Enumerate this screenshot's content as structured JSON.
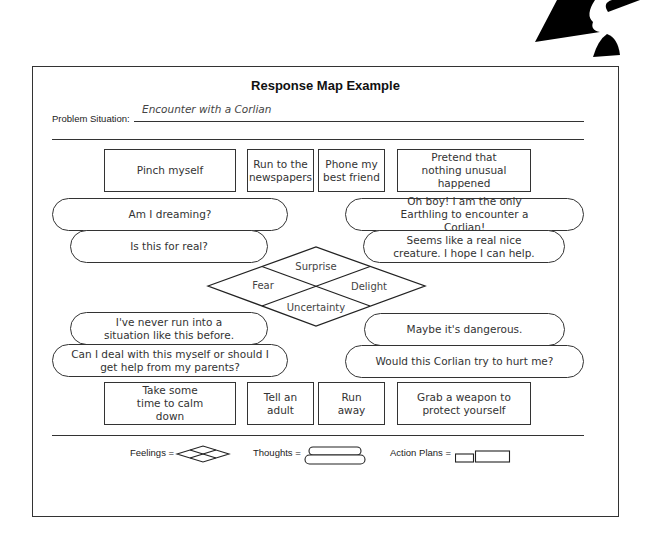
{
  "document": {
    "title": "Response Map Example",
    "problem_situation": {
      "label": "Problem Situation:",
      "value": "Encounter with a Corlian"
    }
  },
  "action_plans_top": [
    {
      "text": "Pinch myself"
    },
    {
      "text": "Run to the newspapers"
    },
    {
      "text": "Phone my best friend"
    },
    {
      "text": "Pretend that nothing unusual happened"
    }
  ],
  "thoughts_upper_left": [
    {
      "text": "Am I dreaming?"
    },
    {
      "text": "Is this for real?"
    }
  ],
  "thoughts_upper_right": [
    {
      "text": "Oh boy! I am the only Earthling to encounter a Corlian!"
    },
    {
      "text": "Seems like a real nice creature. I hope I can help."
    }
  ],
  "feelings": {
    "top": "Surprise",
    "left": "Fear",
    "right": "Delight",
    "bottom": "Uncertainty"
  },
  "thoughts_lower_left": [
    {
      "text": "I've never run into a situation like this before."
    },
    {
      "text": "Can I deal with this myself or should I get help from my parents?"
    }
  ],
  "thoughts_lower_right": [
    {
      "text": "Maybe it's dangerous."
    },
    {
      "text": "Would this Corlian try to hurt me?"
    }
  ],
  "action_plans_bottom": [
    {
      "text": "Take some time to calm down"
    },
    {
      "text": "Tell an adult"
    },
    {
      "text": "Run away"
    },
    {
      "text": "Grab a weapon to protect yourself"
    }
  ],
  "legend": {
    "feelings_label": "Feelings =",
    "thoughts_label": "Thoughts =",
    "action_plans_label": "Action Plans ="
  }
}
